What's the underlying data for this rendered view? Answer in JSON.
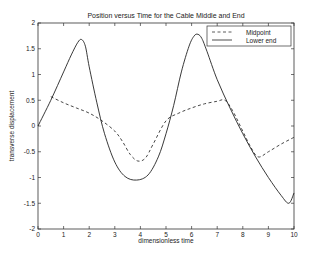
{
  "chart_data": {
    "type": "line",
    "title": "Position versus Time for the Cable Middle and End",
    "xlabel": "dimensionless time",
    "ylabel": "transverse displacement",
    "xlim": [
      0,
      10
    ],
    "ylim": [
      -2,
      2
    ],
    "xticks": [
      0,
      1,
      2,
      3,
      4,
      5,
      6,
      7,
      8,
      9,
      10
    ],
    "yticks": [
      -2,
      -1.5,
      -1,
      -0.5,
      0,
      0.5,
      1,
      1.5,
      2
    ],
    "ytick_labels": [
      "-2",
      "-1.5",
      "-1",
      "-0.5",
      "0",
      "0.5",
      "1",
      "1.5",
      "2"
    ],
    "grid": false,
    "legend_position": "upper right",
    "series": [
      {
        "name": "Midpoint",
        "style": "dashed",
        "color": "#333333",
        "x": [
          0.5,
          1.0,
          1.5,
          2.0,
          2.5,
          3.0,
          3.3,
          3.6,
          3.9,
          4.2,
          4.5,
          5.0,
          5.5,
          6.0,
          6.5,
          7.0,
          7.3,
          7.6,
          8.0,
          8.3,
          8.6,
          9.0,
          9.5,
          10.0
        ],
        "y": [
          0.57,
          0.45,
          0.35,
          0.25,
          0.1,
          -0.1,
          -0.3,
          -0.55,
          -0.68,
          -0.62,
          -0.35,
          0.1,
          0.25,
          0.35,
          0.43,
          0.48,
          0.5,
          0.3,
          -0.1,
          -0.4,
          -0.6,
          -0.5,
          -0.35,
          -0.22
        ]
      },
      {
        "name": "Lower end",
        "style": "solid",
        "color": "#222222",
        "x": [
          0.0,
          0.5,
          1.0,
          1.3,
          1.55,
          1.7,
          1.85,
          2.0,
          2.3,
          2.6,
          3.0,
          3.4,
          3.85,
          4.3,
          4.7,
          5.0,
          5.3,
          5.6,
          5.9,
          6.1,
          6.25,
          6.4,
          6.6,
          7.0,
          7.5,
          8.0,
          8.5,
          9.0,
          9.5,
          9.8,
          10.0
        ],
        "y": [
          0.0,
          0.5,
          1.05,
          1.38,
          1.62,
          1.68,
          1.55,
          1.15,
          0.45,
          -0.15,
          -0.7,
          -0.98,
          -1.05,
          -0.95,
          -0.6,
          -0.15,
          0.4,
          1.05,
          1.55,
          1.75,
          1.78,
          1.7,
          1.45,
          0.9,
          0.35,
          -0.15,
          -0.6,
          -1.0,
          -1.35,
          -1.5,
          -1.3
        ]
      }
    ]
  }
}
